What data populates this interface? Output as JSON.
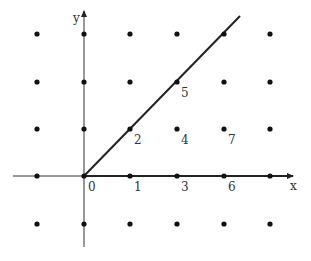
{
  "diagram": {
    "type": "lattice-cone",
    "axes": {
      "x_label": "x",
      "y_label": "y"
    },
    "grid": {
      "columns_px": [
        37,
        84,
        130,
        177,
        224,
        270
      ],
      "rows_px": [
        34,
        82,
        129,
        176,
        224
      ]
    },
    "origin_px": [
      84,
      176
    ],
    "ray": {
      "from": [
        84,
        176
      ],
      "to": [
        240,
        16
      ]
    },
    "labeled_points": [
      {
        "label": "0",
        "x": 84,
        "y": 176
      },
      {
        "label": "1",
        "x": 130,
        "y": 176
      },
      {
        "label": "2",
        "x": 130,
        "y": 129
      },
      {
        "label": "3",
        "x": 177,
        "y": 176
      },
      {
        "label": "4",
        "x": 177,
        "y": 129
      },
      {
        "label": "5",
        "x": 177,
        "y": 82
      },
      {
        "label": "6",
        "x": 224,
        "y": 176
      },
      {
        "label": "7",
        "x": 224,
        "y": 129
      }
    ]
  }
}
